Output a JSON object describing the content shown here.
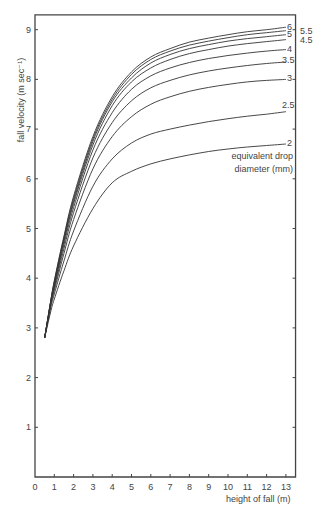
{
  "chart_data": {
    "type": "line",
    "title": "",
    "xlabel": "height of fall (m)",
    "ylabel": "fall velocity (m sec⁻¹)",
    "xlim": [
      0,
      13.5
    ],
    "ylim": [
      0,
      9.3
    ],
    "x_ticks": [
      "0",
      "1",
      "2",
      "3",
      "4",
      "5",
      "6",
      "7",
      "8",
      "9",
      "10",
      "11",
      "12",
      "13"
    ],
    "y_ticks": [
      "1",
      "2",
      "3",
      "4",
      "5",
      "6",
      "7",
      "8",
      "9"
    ],
    "grid": false,
    "legend_title": "equivalent drop diameter (mm)",
    "x": [
      0.5,
      0.8,
      1,
      1.5,
      2,
      3,
      4,
      5,
      6,
      7,
      8,
      9,
      10,
      11,
      12,
      13
    ],
    "series": [
      {
        "name": "6",
        "values": [
          2.8,
          3.5,
          3.95,
          4.85,
          5.65,
          6.85,
          7.65,
          8.15,
          8.45,
          8.62,
          8.75,
          8.83,
          8.9,
          8.96,
          9.0,
          9.05
        ]
      },
      {
        "name": "5.5",
        "values": [
          2.8,
          3.5,
          3.93,
          4.82,
          5.6,
          6.8,
          7.6,
          8.1,
          8.4,
          8.57,
          8.69,
          8.77,
          8.84,
          8.9,
          8.94,
          8.98
        ]
      },
      {
        "name": "5",
        "values": [
          2.8,
          3.5,
          3.9,
          4.78,
          5.55,
          6.75,
          7.55,
          8.03,
          8.33,
          8.5,
          8.62,
          8.7,
          8.77,
          8.82,
          8.86,
          8.9
        ]
      },
      {
        "name": "4.5",
        "values": [
          2.8,
          3.48,
          3.87,
          4.74,
          5.5,
          6.68,
          7.47,
          7.95,
          8.23,
          8.4,
          8.52,
          8.6,
          8.67,
          8.72,
          8.76,
          8.8
        ]
      },
      {
        "name": "4",
        "values": [
          2.8,
          3.46,
          3.84,
          4.68,
          5.42,
          6.58,
          7.33,
          7.8,
          8.07,
          8.23,
          8.34,
          8.42,
          8.48,
          8.53,
          8.57,
          8.6
        ]
      },
      {
        "name": "3.5",
        "values": [
          2.8,
          3.44,
          3.8,
          4.6,
          5.32,
          6.42,
          7.13,
          7.57,
          7.83,
          7.98,
          8.09,
          8.17,
          8.23,
          8.28,
          8.32,
          8.35
        ]
      },
      {
        "name": "3",
        "values": [
          2.8,
          3.42,
          3.75,
          4.5,
          5.18,
          6.2,
          6.85,
          7.25,
          7.5,
          7.65,
          7.76,
          7.84,
          7.9,
          7.95,
          7.98,
          8.0
        ]
      },
      {
        "name": "2.5",
        "values": [
          2.8,
          3.38,
          3.68,
          4.35,
          4.95,
          5.85,
          6.4,
          6.72,
          6.9,
          7.0,
          7.08,
          7.15,
          7.21,
          7.26,
          7.3,
          7.35
        ]
      },
      {
        "name": "2",
        "values": [
          2.8,
          3.3,
          3.58,
          4.15,
          4.65,
          5.4,
          5.92,
          6.15,
          6.3,
          6.4,
          6.48,
          6.55,
          6.6,
          6.64,
          6.67,
          6.7
        ]
      }
    ],
    "label_positions": {
      "6": {
        "x": 287,
        "y": 30
      },
      "5.5": {
        "x": 300,
        "y": 34
      },
      "5": {
        "x": 287,
        "y": 37
      },
      "4.5": {
        "x": 300,
        "y": 43
      },
      "4": {
        "x": 287,
        "y": 52
      },
      "3.5": {
        "x": 282,
        "y": 63
      },
      "3": {
        "x": 287,
        "y": 81
      },
      "2.5": {
        "x": 282,
        "y": 108
      },
      "2": {
        "x": 287,
        "y": 146
      }
    }
  }
}
